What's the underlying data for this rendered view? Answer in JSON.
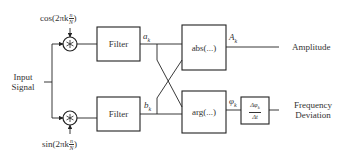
{
  "diagram": {
    "type": "IQ demodulator block diagram",
    "input": {
      "line1": "Input",
      "line2": "Signal"
    },
    "mixers": [
      {
        "name": "top-mixer",
        "symbol": "∗",
        "reference": {
          "prefix": "cos(2πk",
          "num": "n",
          "den": "N",
          "suffix": ")"
        }
      },
      {
        "name": "bottom-mixer",
        "symbol": "∗",
        "reference": {
          "prefix": "sin(2πk",
          "num": "n",
          "den": "N",
          "suffix": ")"
        }
      }
    ],
    "filters": [
      {
        "label": "Filter",
        "output": {
          "base": "a",
          "sub": "k"
        }
      },
      {
        "label": "Filter",
        "output": {
          "base": "b",
          "sub": "k"
        }
      }
    ],
    "operators": [
      {
        "label": "abs(...)",
        "output": {
          "base": "A",
          "sub": "k"
        }
      },
      {
        "label": "arg(...)",
        "output": {
          "base": "φ",
          "sub": "k"
        }
      }
    ],
    "derivative": {
      "num": "Δφ",
      "num_sub": "k",
      "den": "Δt"
    },
    "outputs": [
      {
        "line1": "Amplitude"
      },
      {
        "line1": "Frequency",
        "line2": "Deviation"
      }
    ]
  }
}
